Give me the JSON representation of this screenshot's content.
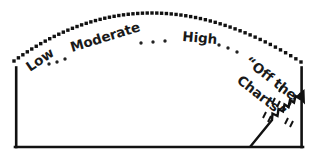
{
  "chart_data": {
    "type": "scatter",
    "title": "",
    "subtitle": "",
    "xlabel": "",
    "ylabel": "",
    "grid": false,
    "legend": null,
    "style": "hand-drawn sketch",
    "categories": [
      "Low",
      "Moderate",
      "High",
      "“Off the Charts”"
    ],
    "values": [
      1,
      2,
      3,
      4
    ],
    "annotations": [
      {
        "name": "low",
        "text": "Low",
        "x": 30,
        "y": 72,
        "rotation": -34
      },
      {
        "name": "moderate",
        "text": "Moderate",
        "x": 72,
        "y": 52,
        "rotation": -17
      },
      {
        "name": "high",
        "text": "High",
        "x": 182,
        "y": 41,
        "rotation": 5
      },
      {
        "name": "off-the-charts-line1",
        "text": "“Off the",
        "x": 244,
        "y": 63,
        "rotation": 38
      },
      {
        "name": "off-the-charts-line2",
        "text": "Charts”",
        "x": 236,
        "y": 82,
        "rotation": 38
      }
    ],
    "separators": [
      {
        "x": 49,
        "y": 64
      },
      {
        "x": 57,
        "y": 62
      },
      {
        "x": 65,
        "y": 59
      },
      {
        "x": 141,
        "y": 43
      },
      {
        "x": 153,
        "y": 42
      },
      {
        "x": 165,
        "y": 41
      },
      {
        "x": 219,
        "y": 45
      },
      {
        "x": 228,
        "y": 48
      },
      {
        "x": 237,
        "y": 52
      }
    ],
    "arc": {
      "start": [
        14,
        61
      ],
      "apex": [
        152,
        13
      ],
      "end": [
        301,
        62
      ],
      "dot_count": 60,
      "dot_size": 3.4,
      "color": "#111111"
    },
    "frame": {
      "left_x": 15,
      "right_x": 302,
      "top_y": 67,
      "bottom_y": 148,
      "color": "#111111"
    },
    "trend": {
      "base": [
        250,
        147
      ],
      "tip": [
        303,
        93
      ],
      "zigzag_teeth": 6,
      "color": "#111111"
    },
    "colors": {
      "ink": "#111111",
      "background": "#ffffff"
    }
  }
}
